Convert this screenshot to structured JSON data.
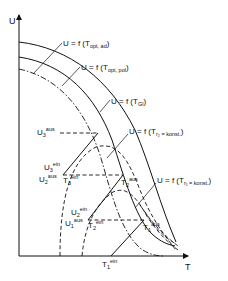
{
  "axes": {
    "y_label": "U",
    "x_label": "T"
  },
  "curves": {
    "opt_ad": {
      "prefix": "U = f (T",
      "sub": "opt, ad",
      "suffix": ")"
    },
    "opt_pol": {
      "prefix": "U = f (T",
      "sub": "opt, pol",
      "suffix": ")"
    },
    "gl": {
      "prefix": "U = f (T",
      "sub": "Gl",
      "suffix": ")"
    },
    "r2": {
      "prefix": "U = f (T",
      "sub": "r₂ = konst.",
      "suffix": ")"
    },
    "r1": {
      "prefix": "U = f (T",
      "sub": "r₁ = konst.",
      "suffix": ")"
    }
  },
  "points": {
    "U3_aus": {
      "base": "U",
      "idx": "3",
      "sup": "aus"
    },
    "U3_ein": {
      "base": "U",
      "idx": "3",
      "sup": "ein"
    },
    "U2_aus": {
      "base": "U",
      "idx": "2",
      "sup": "aus"
    },
    "T3_ein": {
      "base": "T",
      "idx": "3",
      "sup": "ein"
    },
    "T2_aus": {
      "base": "T",
      "idx": "2",
      "sup": "aus"
    },
    "U2_ein": {
      "base": "U",
      "idx": "2",
      "sup": "ein"
    },
    "U1_aus": {
      "base": "U",
      "idx": "1",
      "sup": "aus"
    },
    "T2_ein": {
      "base": "T",
      "idx": "2",
      "sup": "ein"
    },
    "T1_aus": {
      "base": "T",
      "idx": "1",
      "sup": "aus"
    },
    "T1_ein": {
      "base": "T",
      "idx": "1",
      "sup": "ein"
    }
  },
  "colors": {
    "line": "#111111",
    "background": "#ffffff"
  }
}
